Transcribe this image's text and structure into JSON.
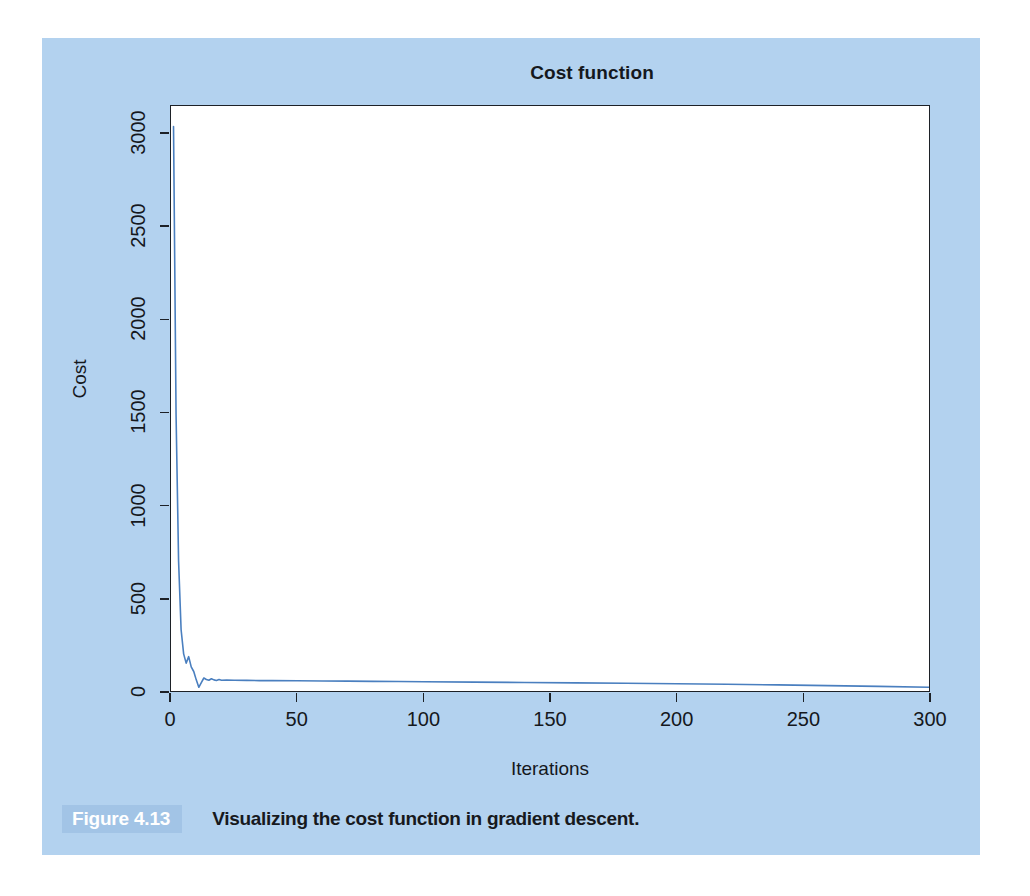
{
  "figure": {
    "badge_label": "Figure 4.13",
    "caption": "Visualizing the cost function in gradient descent.",
    "panel_color": "#b3d2ef",
    "badge_color": "#a2c4e6"
  },
  "chart_data": {
    "type": "line",
    "title": "Cost function",
    "xlabel": "Iterations",
    "ylabel": "Cost",
    "xlim": [
      0,
      300
    ],
    "ylim": [
      0,
      3150
    ],
    "xticks": [
      0,
      50,
      100,
      150,
      200,
      250,
      300
    ],
    "yticks": [
      0,
      500,
      1000,
      1500,
      2000,
      2500,
      3000
    ],
    "grid": false,
    "legend": "none",
    "line_color": "#4a7fbf",
    "line_width": 1.6,
    "series": [
      {
        "name": "Cost",
        "x": [
          1,
          2,
          3,
          4,
          5,
          6,
          7,
          8,
          9,
          10,
          11,
          12,
          13,
          14,
          15,
          16,
          17,
          18,
          19,
          20,
          22,
          25,
          30,
          35,
          40,
          50,
          60,
          70,
          80,
          90,
          100,
          120,
          140,
          160,
          180,
          200,
          220,
          240,
          260,
          280,
          300
        ],
        "values": [
          3040,
          1490,
          700,
          330,
          200,
          150,
          185,
          130,
          105,
          60,
          20,
          45,
          70,
          62,
          58,
          66,
          60,
          57,
          62,
          58,
          59,
          58,
          57,
          56,
          56,
          55,
          54,
          53,
          52,
          51,
          50,
          48,
          46,
          44,
          42,
          39,
          36,
          33,
          29,
          25,
          20
        ]
      }
    ]
  }
}
